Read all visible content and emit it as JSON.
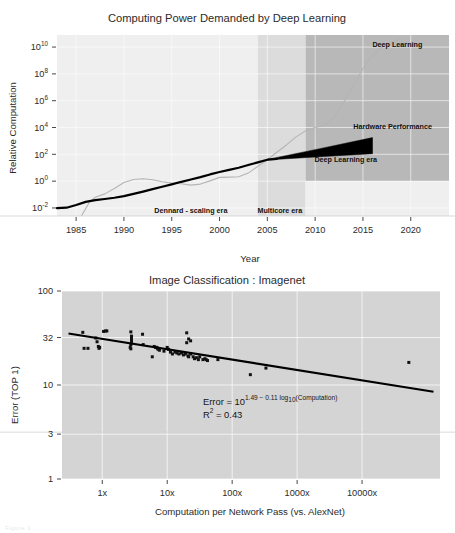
{
  "figure": {
    "background": "#ffffff",
    "faint_caption": "Figure 1"
  },
  "chart_data": [
    {
      "id": "computing-power",
      "type": "line",
      "title": "Computing Power Demanded by Deep Learning",
      "xlabel": "Year",
      "ylabel": "Relative Computation",
      "xlim": [
        1983,
        2024
      ],
      "ylim_log10": [
        -2.6,
        10.9
      ],
      "xticks": [
        1985,
        1990,
        1995,
        2000,
        2005,
        2010,
        2015,
        2020
      ],
      "xticklabels": [
        "1985",
        "1990",
        "1995",
        "2000",
        "2005",
        "2010",
        "2015",
        "2020"
      ],
      "yticks_log10": [
        -2,
        0,
        2,
        4,
        6,
        8,
        10
      ],
      "yticklabels": [
        "10-2",
        "10 0",
        "10 2",
        "10 4",
        "10 6",
        "10 8",
        "10 10"
      ],
      "ytick_mantissa": "10",
      "ytick_exponents": [
        "-2",
        "0",
        "2",
        "4",
        "6",
        "8",
        "10"
      ],
      "grid": true,
      "legend_position": "inline-annotations",
      "annotations": [
        {
          "text": "Deep Learning",
          "x": 2018.6,
          "y_log10": 10.0
        },
        {
          "text": "Hardware Performance",
          "x": 2018.1,
          "y_log10": 3.9
        },
        {
          "text": "Deep Learning era",
          "x": 2013.2,
          "y_log10": 1.45
        },
        {
          "text": "Dennard - scaling era",
          "x": 1997.0,
          "y_log10": -2.35
        },
        {
          "text": "Multicore era",
          "x": 2006.3,
          "y_log10": -2.35
        }
      ],
      "eras": [
        {
          "name": "Dennard - scaling era",
          "x_start": 1983,
          "x_end": 2004,
          "shade": "#efefef"
        },
        {
          "name": "Multicore era",
          "x_start": 2004,
          "x_end": 2009,
          "shade": "#dcdcdc"
        },
        {
          "name": "Deep Learning era",
          "x_start": 2009,
          "x_end": 2024,
          "shade": "#b8b8b8"
        }
      ],
      "series": [
        {
          "name": "Hardware Performance",
          "color": "#000000",
          "style": "solid-thick",
          "points": [
            [
              1983,
              -2.02
            ],
            [
              1984,
              -1.98
            ],
            [
              1985,
              -1.78
            ],
            [
              1986,
              -1.55
            ],
            [
              1987,
              -1.42
            ],
            [
              1988,
              -1.33
            ],
            [
              1989,
              -1.24
            ],
            [
              1990,
              -1.12
            ],
            [
              1991,
              -0.95
            ],
            [
              1992,
              -0.78
            ],
            [
              1993,
              -0.6
            ],
            [
              1994,
              -0.42
            ],
            [
              1995,
              -0.24
            ],
            [
              1996,
              -0.05
            ],
            [
              1997,
              0.12
            ],
            [
              1998,
              0.3
            ],
            [
              1999,
              0.5
            ],
            [
              2000,
              0.68
            ],
            [
              2001,
              0.84
            ],
            [
              2002,
              1.0
            ],
            [
              2003,
              1.2
            ],
            [
              2004,
              1.4
            ],
            [
              2005,
              1.6
            ],
            [
              2006,
              1.65
            ]
          ]
        },
        {
          "name": "Deep Learning",
          "color": "#b4b4b4",
          "style": "solid-thin",
          "points": [
            [
              1985.6,
              -2.55
            ],
            [
              1986.4,
              -1.55
            ],
            [
              1987.0,
              -1.2
            ],
            [
              1988.0,
              -0.95
            ],
            [
              1989.0,
              -0.55
            ],
            [
              1990.0,
              -0.1
            ],
            [
              1991.0,
              0.12
            ],
            [
              1992.0,
              0.18
            ],
            [
              1993.0,
              0.1
            ],
            [
              1994.0,
              -0.05
            ],
            [
              1995.0,
              -0.15
            ],
            [
              1996.0,
              -0.2
            ],
            [
              1997.0,
              -0.3
            ],
            [
              1998.0,
              -0.22
            ],
            [
              1999.0,
              0.02
            ],
            [
              2000.0,
              0.28
            ],
            [
              2001.0,
              0.3
            ],
            [
              2002.0,
              0.33
            ],
            [
              2003.0,
              0.6
            ],
            [
              2004.0,
              1.1
            ],
            [
              2005.0,
              1.6
            ],
            [
              2006.0,
              2.15
            ],
            [
              2007.0,
              2.7
            ],
            [
              2008.0,
              3.3
            ],
            [
              2009.0,
              3.75
            ],
            [
              2010.0,
              4.0
            ],
            [
              2011.0,
              4.15
            ],
            [
              2012.0,
              4.8
            ],
            [
              2013.0,
              5.9
            ],
            [
              2014.0,
              7.1
            ],
            [
              2015.0,
              8.4
            ],
            [
              2016.0,
              9.4
            ],
            [
              2017.0,
              10.0
            ],
            [
              2018.0,
              10.35
            ],
            [
              2019.0,
              10.6
            ]
          ]
        }
      ],
      "wedge": {
        "name": "Hardware Performance wedge",
        "color": "#000000",
        "apex": [
          2005.0,
          1.6
        ],
        "upper": [
          [
            2005.0,
            1.62
          ],
          [
            2010.0,
            2.35
          ],
          [
            2016.0,
            3.25
          ]
        ],
        "lower": [
          [
            2016.0,
            2.05
          ],
          [
            2010.0,
            1.8
          ],
          [
            2005.0,
            1.58
          ]
        ]
      }
    },
    {
      "id": "imagenet-error",
      "type": "scatter",
      "title": "Image Classification : Imagenet",
      "xlabel": "Computation per Network Pass (vs. AlexNet)",
      "ylabel": "Error (TOP 1)",
      "xlim_log10": [
        -0.62,
        5.2
      ],
      "ylim_log10": [
        0,
        2
      ],
      "xticks_log10": [
        0,
        1,
        2,
        3,
        4
      ],
      "xticklabels": [
        "1x",
        "10x",
        "100x",
        "1000x",
        "10000x"
      ],
      "yticks": [
        100,
        32,
        10,
        3,
        1
      ],
      "yticklabels": [
        "100",
        "32",
        "10",
        "3",
        "1"
      ],
      "grid": true,
      "legend_position": "none",
      "annotation_equation": {
        "line1_prefix": "Error = 10",
        "line1_exponent": "1.49 − 0.11 log",
        "line1_exponent_sub": "10",
        "line1_exponent_tail": "(Computation)",
        "line2_prefix": "R",
        "line2_sup": "2",
        "line2_tail": " = 0.43"
      },
      "fit_line": {
        "name": "regression",
        "color": "#000000",
        "intercept_log10_error": 1.49,
        "slope": -0.11,
        "x_start_log10": -0.52,
        "x_end_log10": 5.1
      },
      "points": [
        [
          -0.3,
          1.56
        ],
        [
          -0.28,
          1.39
        ],
        [
          -0.22,
          1.39
        ],
        [
          -0.1,
          1.5
        ],
        [
          -0.08,
          1.46
        ],
        [
          -0.06,
          1.41
        ],
        [
          -0.05,
          1.39
        ],
        [
          -0.04,
          1.4
        ],
        [
          0.02,
          1.57
        ],
        [
          0.05,
          1.575
        ],
        [
          0.07,
          1.575
        ],
        [
          0.44,
          1.565
        ],
        [
          0.45,
          1.52
        ],
        [
          0.45,
          1.495
        ],
        [
          0.45,
          1.47
        ],
        [
          0.45,
          1.45
        ],
        [
          0.44,
          1.43
        ],
        [
          0.43,
          1.4
        ],
        [
          0.44,
          1.385
        ],
        [
          0.62,
          1.54
        ],
        [
          0.63,
          1.43
        ],
        [
          0.77,
          1.3
        ],
        [
          0.8,
          1.41
        ],
        [
          0.82,
          1.4
        ],
        [
          0.84,
          1.4
        ],
        [
          0.85,
          1.39
        ],
        [
          0.86,
          1.38
        ],
        [
          0.88,
          1.37
        ],
        [
          0.95,
          1.36
        ],
        [
          1.0,
          1.4
        ],
        [
          1.02,
          1.38
        ],
        [
          1.05,
          1.35
        ],
        [
          1.08,
          1.33
        ],
        [
          1.12,
          1.35
        ],
        [
          1.15,
          1.34
        ],
        [
          1.18,
          1.33
        ],
        [
          1.22,
          1.34
        ],
        [
          1.25,
          1.32
        ],
        [
          1.28,
          1.33
        ],
        [
          1.32,
          1.31
        ],
        [
          1.33,
          1.3
        ],
        [
          1.36,
          1.33
        ],
        [
          1.4,
          1.3
        ],
        [
          1.42,
          1.28
        ],
        [
          1.45,
          1.29
        ],
        [
          1.48,
          1.27
        ],
        [
          1.3,
          1.555
        ],
        [
          1.33,
          1.49
        ],
        [
          1.36,
          1.47
        ],
        [
          1.3,
          1.45
        ],
        [
          1.5,
          1.3
        ],
        [
          1.55,
          1.27
        ],
        [
          1.58,
          1.28
        ],
        [
          1.6,
          1.27
        ],
        [
          1.62,
          1.26
        ],
        [
          1.78,
          1.27
        ],
        [
          2.28,
          1.11
        ],
        [
          2.52,
          1.18
        ],
        [
          4.72,
          1.24
        ]
      ]
    }
  ]
}
